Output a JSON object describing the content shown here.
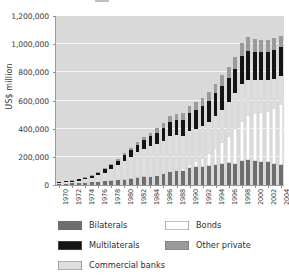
{
  "chart_data": {
    "type": "bar",
    "stacked": true,
    "title": "",
    "xlabel": "",
    "ylabel": "US$ million",
    "ylim": [
      0,
      1200000
    ],
    "ytick_step": 200000,
    "ytick_labels": [
      "0",
      "200,000",
      "400,000",
      "600,000",
      "800,000",
      "1,000,000",
      "1,200,000"
    ],
    "ytick_values": [
      0,
      200000,
      400000,
      600000,
      800000,
      1000000,
      1200000
    ],
    "grid": "horizontal",
    "legend_position": "below",
    "xtick_interval": 2,
    "x": [
      1970,
      1971,
      1972,
      1973,
      1974,
      1975,
      1976,
      1977,
      1978,
      1979,
      1980,
      1981,
      1982,
      1983,
      1984,
      1985,
      1986,
      1987,
      1988,
      1989,
      1990,
      1991,
      1992,
      1993,
      1994,
      1995,
      1996,
      1997,
      1998,
      1999,
      2000,
      2001,
      2002,
      2003,
      2004
    ],
    "xtick_labels": [
      "1970",
      "1972",
      "1974",
      "1976",
      "1978",
      "1980",
      "1982",
      "1984",
      "1986",
      "1988",
      "1990",
      "1992",
      "1994",
      "1996",
      "1998",
      "2000",
      "2002",
      "2004"
    ],
    "stack_order_bottom_to_top": [
      "Bilaterals",
      "Bonds",
      "Commercial banks",
      "Multilaterals",
      "Other private"
    ],
    "series": [
      {
        "name": "Bilaterals",
        "color": "#6e6e6e",
        "values": [
          8000,
          9000,
          11000,
          13000,
          15000,
          18000,
          21000,
          25000,
          30000,
          34000,
          39000,
          43000,
          48000,
          54000,
          59000,
          66000,
          76000,
          90000,
          96000,
          98000,
          118000,
          126000,
          128000,
          133000,
          140000,
          152000,
          155000,
          152000,
          168000,
          178000,
          172000,
          166000,
          160000,
          152000,
          145000
        ]
      },
      {
        "name": "Bonds",
        "color": "#ffffff",
        "values": [
          1000,
          1200,
          1500,
          1800,
          2000,
          2400,
          3000,
          3600,
          4200,
          5000,
          6000,
          7000,
          8000,
          9000,
          10000,
          12000,
          14000,
          17000,
          20000,
          24000,
          32000,
          44000,
          62000,
          92000,
          124000,
          150000,
          196000,
          250000,
          290000,
          318000,
          338000,
          352000,
          368000,
          398000,
          430000
        ]
      },
      {
        "name": "Commercial banks",
        "color": "#dedede",
        "values": [
          6000,
          8000,
          11000,
          16000,
          23000,
          32000,
          44000,
          60000,
          80000,
          102000,
          128000,
          152000,
          176000,
          196000,
          208000,
          216000,
          222000,
          238000,
          236000,
          228000,
          232000,
          228000,
          226000,
          222000,
          226000,
          232000,
          236000,
          248000,
          262000,
          252000,
          238000,
          226000,
          216000,
          206000,
          196000
        ]
      },
      {
        "name": "Multilaterals",
        "color": "#141414",
        "values": [
          6000,
          7000,
          8000,
          10000,
          12000,
          15000,
          18000,
          22000,
          27000,
          32000,
          38000,
          44000,
          52000,
          60000,
          68000,
          78000,
          90000,
          104000,
          110000,
          114000,
          126000,
          134000,
          142000,
          150000,
          160000,
          172000,
          172000,
          176000,
          196000,
          206000,
          200000,
          198000,
          200000,
          204000,
          208000
        ]
      },
      {
        "name": "Other private",
        "color": "#9b9b9b",
        "values": [
          2000,
          2500,
          3000,
          4000,
          5000,
          6000,
          7000,
          9000,
          11000,
          13000,
          16000,
          19000,
          22000,
          25000,
          28000,
          32000,
          36000,
          42000,
          44000,
          46000,
          52000,
          56000,
          60000,
          64000,
          70000,
          76000,
          80000,
          86000,
          94000,
          96000,
          92000,
          88000,
          86000,
          84000,
          82000
        ]
      }
    ]
  },
  "legend": {
    "items": [
      {
        "label": "Bilaterals",
        "color": "#6e6e6e"
      },
      {
        "label": "Bonds",
        "color": "#ffffff"
      },
      {
        "label": "Multilaterals",
        "color": "#141414"
      },
      {
        "label": "Other private",
        "color": "#9b9b9b"
      },
      {
        "label": "Commercial banks",
        "color": "#dedede"
      }
    ]
  },
  "colors": {
    "plot_background": "#d9d9d9",
    "gridline": "#f4f4f4",
    "axis": "#9a9a9a",
    "text": "#3a3a3a",
    "page_background": "#ffffff"
  }
}
